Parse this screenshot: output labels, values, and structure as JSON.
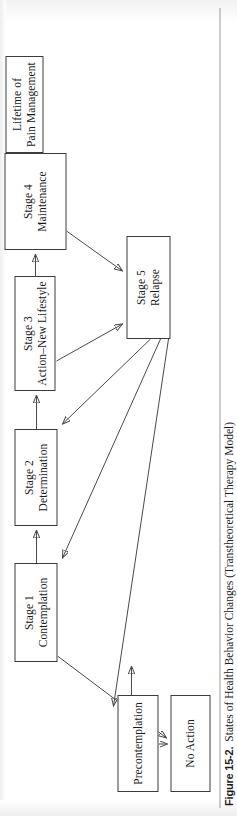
{
  "figure": {
    "number_label": "Figure 15-2.",
    "caption": "States of Health Behavior Changes (Transtheoretical Therapy Model)",
    "orientation": "rotated-90-ccw",
    "line_color": "#4a4a4a",
    "box_border_color": "#3c3c3c",
    "text_color": "#1a1a1a",
    "background_color": "#ffffff"
  },
  "diagram": {
    "type": "flowchart",
    "nodes": [
      {
        "id": "precontemplation",
        "lines": [
          "Precontemplation"
        ]
      },
      {
        "id": "no_action",
        "lines": [
          "No Action"
        ]
      },
      {
        "id": "stage1",
        "lines": [
          "Stage 1",
          "Contemplation"
        ]
      },
      {
        "id": "stage2",
        "lines": [
          "Stage 2",
          "Determination"
        ]
      },
      {
        "id": "stage3",
        "lines": [
          "Stage 3",
          "Action–New Lifestyle"
        ]
      },
      {
        "id": "stage4",
        "lines": [
          "Stage 4",
          "Maintenance"
        ]
      },
      {
        "id": "stage5",
        "lines": [
          "Stage 5",
          "Relapse"
        ]
      },
      {
        "id": "lifetime",
        "lines": [
          "Lifetime of",
          "Pain Management"
        ]
      }
    ],
    "edges": [
      {
        "from": "precontemplation",
        "to": "no_action",
        "style": "arrow"
      },
      {
        "from": "precontemplation",
        "to": "stage1",
        "style": "arrow"
      },
      {
        "from": "stage1",
        "to": "stage2",
        "style": "arrow"
      },
      {
        "from": "stage2",
        "to": "stage3",
        "style": "arrow"
      },
      {
        "from": "stage3",
        "to": "stage4",
        "style": "arrow"
      },
      {
        "from": "stage4",
        "to": "lifetime",
        "style": "arrow"
      },
      {
        "from": "stage4",
        "to": "stage5",
        "style": "arrow"
      },
      {
        "from": "stage3",
        "to": "stage5",
        "style": "arrow"
      },
      {
        "from": "stage5",
        "to": "stage2",
        "style": "arrow"
      },
      {
        "from": "stage5",
        "to": "stage1",
        "style": "arrow"
      },
      {
        "from": "stage5",
        "to": "precontemplation",
        "style": "arrow"
      },
      {
        "from": "stage1",
        "to": "no_action",
        "style": "arrow"
      }
    ]
  }
}
